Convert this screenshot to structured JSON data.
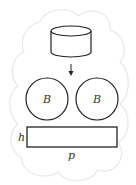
{
  "diagram": {
    "labels": {
      "circle_left": "B",
      "circle_right": "B",
      "rect_height": "h",
      "rect_width": "p"
    },
    "colors": {
      "stroke": "#222222",
      "cloud": "#e6e6e6",
      "label": "#333333"
    }
  }
}
